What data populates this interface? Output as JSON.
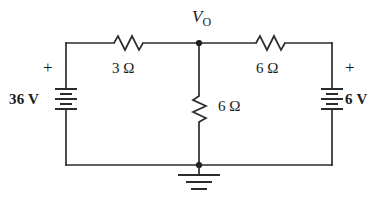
{
  "figure": {
    "type": "circuit-schematic",
    "title_label": "V",
    "node_voltage_label": {
      "symbol": "V",
      "subscript": "O",
      "full": "VO"
    },
    "background_color": "#ffffff",
    "line_color": "#2b2b2b"
  },
  "sources": [
    {
      "id": "source-left",
      "value": "36 V",
      "polarity_mark": "+",
      "orientation": "vertical",
      "side": "left"
    },
    {
      "id": "source-right",
      "value": "6 V",
      "polarity_mark": "+",
      "orientation": "vertical",
      "side": "right"
    }
  ],
  "resistors": [
    {
      "id": "resistor-top-left",
      "value": "3",
      "unit": "Ω",
      "label": "3 Ω",
      "orientation": "horizontal",
      "position": "top-left-branch"
    },
    {
      "id": "resistor-top-right",
      "value": "6",
      "unit": "Ω",
      "label": "6 Ω",
      "orientation": "horizontal",
      "position": "top-right-branch"
    },
    {
      "id": "resistor-middle",
      "value": "6",
      "unit": "Ω",
      "label": "6 Ω",
      "orientation": "vertical",
      "position": "center-shunt-branch"
    }
  ],
  "ground": {
    "id": "ground-symbol",
    "label": "ground",
    "bars": 3
  },
  "nodes": [
    {
      "id": "node-top-center",
      "label": "VO"
    },
    {
      "id": "node-bottom-center",
      "label": "ground-node"
    }
  ]
}
